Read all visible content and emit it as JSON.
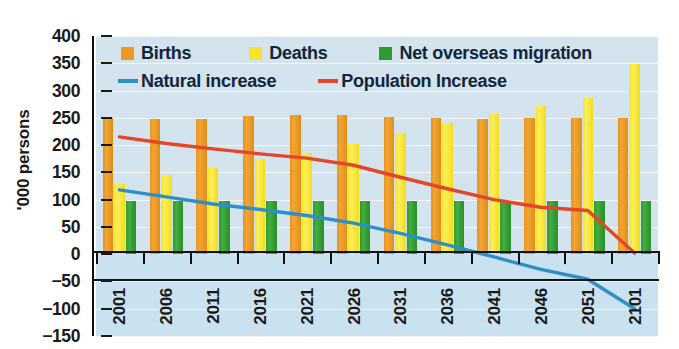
{
  "chart_data": {
    "type": "bar",
    "title": "",
    "subtitle": "",
    "xlabel": "",
    "ylabel": "'000 persons",
    "ylim": [
      -150,
      400
    ],
    "ytick_step": 50,
    "yticks": [
      "400",
      "350",
      "300",
      "250",
      "200",
      "150",
      "100",
      "50",
      "0",
      "−50",
      "−100",
      "−150"
    ],
    "ytick_values": [
      400,
      350,
      300,
      250,
      200,
      150,
      100,
      50,
      0,
      -50,
      -100,
      -150
    ],
    "grid": true,
    "legend_position": "inside-top-left",
    "categories": [
      "2001",
      "2006",
      "2011",
      "2016",
      "2021",
      "2026",
      "2031",
      "2036",
      "2041",
      "2046",
      "2051",
      "2101"
    ],
    "series": [
      {
        "name": "Births",
        "kind": "bar",
        "color": "#ea9a24",
        "values": [
          250,
          248,
          247,
          254,
          255,
          255,
          252,
          249,
          248,
          249,
          250,
          250
        ]
      },
      {
        "name": "Deaths",
        "kind": "bar",
        "color": "#f7e22d",
        "values": [
          128,
          145,
          158,
          175,
          186,
          202,
          223,
          241,
          257,
          272,
          287,
          348
        ]
      },
      {
        "name": "Net overseas migration",
        "kind": "bar",
        "color": "#2f9c2f",
        "values": [
          97,
          97,
          97,
          97,
          97,
          97,
          97,
          97,
          97,
          97,
          97,
          97
        ]
      },
      {
        "name": "Natural increase",
        "kind": "line",
        "color": "#2e8fc7",
        "values": [
          118,
          105,
          92,
          82,
          71,
          57,
          38,
          17,
          -5,
          -28,
          -46,
          -100
        ]
      },
      {
        "name": "Population Increase",
        "kind": "line",
        "color": "#e4462a",
        "values": [
          215,
          203,
          193,
          184,
          176,
          163,
          141,
          120,
          100,
          86,
          80,
          2
        ]
      }
    ]
  },
  "axis": {
    "y_title": "'000 persons"
  },
  "legend": {
    "items": [
      {
        "label": "Births",
        "color": "#ea9a24",
        "marker": "square"
      },
      {
        "label": "Deaths",
        "color": "#f7e22d",
        "marker": "square"
      },
      {
        "label": "Net overseas migration",
        "color": "#2f9c2f",
        "marker": "square"
      },
      {
        "label": "Natural increase",
        "color": "#2e8fc7",
        "marker": "line"
      },
      {
        "label": "Population Increase",
        "color": "#e4462a",
        "marker": "line"
      }
    ]
  }
}
